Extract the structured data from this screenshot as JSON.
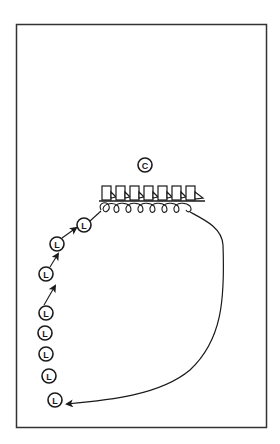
{
  "diagram": {
    "type": "drill-diagram",
    "frame": {
      "x": 16,
      "y": 24,
      "width": 250,
      "height": 403,
      "color": "#333333"
    },
    "coach": {
      "label": "C",
      "x": 145,
      "y": 165,
      "r": 7
    },
    "obstacle": {
      "name": "hurdle row",
      "count": 7,
      "start_x": 102,
      "spacing": 14,
      "top_y": 186,
      "base_y": 201,
      "base_x1": 99,
      "base_x2": 205
    },
    "players": [
      {
        "label": "L",
        "x": 84,
        "y": 225
      },
      {
        "label": "L",
        "x": 57,
        "y": 244
      },
      {
        "label": "L",
        "x": 46,
        "y": 274
      },
      {
        "label": "L",
        "x": 46,
        "y": 313
      },
      {
        "label": "L",
        "x": 45,
        "y": 333
      },
      {
        "label": "L",
        "x": 46,
        "y": 354
      },
      {
        "label": "L",
        "x": 49,
        "y": 376
      },
      {
        "label": "L",
        "x": 55,
        "y": 400
      }
    ],
    "return_path": {
      "description": "curved return run from end of hurdles back to line",
      "arrow_end": [
        67,
        404
      ]
    },
    "line_color": "#1a1a1a"
  }
}
